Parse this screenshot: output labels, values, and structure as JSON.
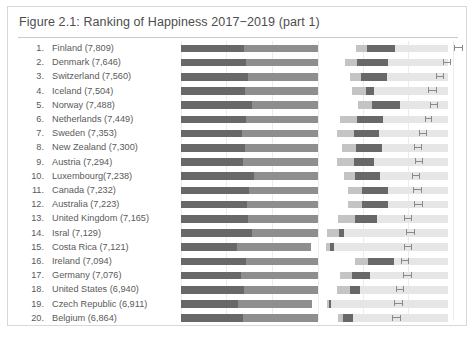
{
  "figure": {
    "title": "Figure 2.1: Ranking of Happiness 2017−2019 (part 1)"
  },
  "chart_data": {
    "type": "bar",
    "title": "Figure 2.1: Ranking of Happiness 2017−2019 (part 1)",
    "subtitle": "",
    "xlabel": "",
    "ylabel": "",
    "orientation": "horizontal",
    "stacked": true,
    "grid": true,
    "legend_position": "none",
    "axis_labels_visible": false,
    "note": "Horizontal stacked bars per country: a left bar group (dark + medium grey segments) and a right bar group (light + dark + very light segments) followed by a small horizontal error-bar marker at the far right.",
    "colors": {
      "dark": "#686868",
      "mid": "#8e8e8e",
      "light": "#c4c4c4",
      "faint": "#e6e6e6",
      "error_bar": "#8a8a8a",
      "gridline": "#ececec",
      "frame": "#d8d8d8",
      "rule": "#c9c9c9",
      "text": "#5a5a5a"
    },
    "series": [
      {
        "name": "left-dark"
      },
      {
        "name": "left-mid"
      },
      {
        "name": "right-light"
      },
      {
        "name": "right-dark"
      },
      {
        "name": "right-faint"
      }
    ],
    "categories": [
      "Finland",
      "Denmark",
      "Switzerland",
      "Iceland",
      "Norway",
      "Netherlands",
      "Sweden",
      "New Zealand",
      "Austria",
      "Luxembourg",
      "Canada",
      "Australia",
      "United Kingdom",
      "Isral",
      "Costa Rica",
      "Ireland",
      "Germany",
      "United States",
      "Czech Republic",
      "Belgium"
    ],
    "values": [
      7.809,
      7.646,
      7.56,
      7.504,
      7.488,
      7.449,
      7.353,
      7.3,
      7.294,
      7.238,
      7.232,
      7.223,
      7.165,
      7.129,
      7.121,
      7.094,
      7.076,
      6.94,
      6.911,
      6.864
    ],
    "rows": [
      {
        "rank": "1.",
        "label": "Finland (7,809)",
        "score": 7.809,
        "left_dark": 63,
        "left_total": 137,
        "right_start": 30,
        "right_light": 11,
        "right_dark": 28,
        "right_end": 122,
        "err_x": 128,
        "err_w": 9
      },
      {
        "rank": "2.",
        "label": "Denmark (7,646)",
        "score": 7.646,
        "left_dark": 65,
        "left_total": 137,
        "right_start": 19,
        "right_light": 12,
        "right_dark": 31,
        "right_end": 122,
        "err_x": 117,
        "err_w": 8
      },
      {
        "rank": "3.",
        "label": "Switzerland (7,560)",
        "score": 7.56,
        "left_dark": 67,
        "left_total": 137,
        "right_start": 24,
        "right_light": 11,
        "right_dark": 26,
        "right_end": 122,
        "err_x": 110,
        "err_w": 8
      },
      {
        "rank": "4.",
        "label": "Iceland (7,504)",
        "score": 7.504,
        "left_dark": 64,
        "left_total": 137,
        "right_start": 26,
        "right_light": 14,
        "right_dark": 8,
        "right_end": 122,
        "err_x": 102,
        "err_w": 9
      },
      {
        "rank": "5.",
        "label": "Norway (7,488)",
        "score": 7.488,
        "left_dark": 71,
        "left_total": 137,
        "right_start": 32,
        "right_light": 14,
        "right_dark": 28,
        "right_end": 122,
        "err_x": 104,
        "err_w": 8
      },
      {
        "rank": "6.",
        "label": "Netherlands (7,449)",
        "score": 7.449,
        "left_dark": 65,
        "left_total": 137,
        "right_start": 14,
        "right_light": 17,
        "right_dark": 26,
        "right_end": 122,
        "err_x": 99,
        "err_w": 7
      },
      {
        "rank": "7.",
        "label": "Sweden (7,353)",
        "score": 7.353,
        "left_dark": 61,
        "left_total": 137,
        "right_start": 11,
        "right_light": 17,
        "right_dark": 25,
        "right_end": 122,
        "err_x": 93,
        "err_w": 8
      },
      {
        "rank": "8.",
        "label": "New Zealand (7,300)",
        "score": 7.3,
        "left_dark": 64,
        "left_total": 137,
        "right_start": 16,
        "right_light": 14,
        "right_dark": 26,
        "right_end": 122,
        "err_x": 88,
        "err_w": 8
      },
      {
        "rank": "9.",
        "label": "Austria (7,294)",
        "score": 7.294,
        "left_dark": 62,
        "left_total": 137,
        "right_start": 11,
        "right_light": 17,
        "right_dark": 20,
        "right_end": 122,
        "err_x": 89,
        "err_w": 8
      },
      {
        "rank": "10.",
        "label": "Luxembourg(7,238)",
        "score": 7.238,
        "left_dark": 73,
        "left_total": 137,
        "right_start": 18,
        "right_light": 11,
        "right_dark": 25,
        "right_end": 122,
        "err_x": 86,
        "err_w": 8
      },
      {
        "rank": "11.",
        "label": "Canada (7,232)",
        "score": 7.232,
        "left_dark": 68,
        "left_total": 137,
        "right_start": 22,
        "right_light": 14,
        "right_dark": 26,
        "right_end": 122,
        "err_x": 87,
        "err_w": 9
      },
      {
        "rank": "12.",
        "label": "Australia (7,223)",
        "score": 7.223,
        "left_dark": 66,
        "left_total": 137,
        "right_start": 22,
        "right_light": 14,
        "right_dark": 26,
        "right_end": 122,
        "err_x": 88,
        "err_w": 9
      },
      {
        "rank": "13.",
        "label": "United Kingdom (7,165)",
        "score": 7.165,
        "left_dark": 67,
        "left_total": 137,
        "right_start": 12,
        "right_light": 17,
        "right_dark": 22,
        "right_end": 122,
        "err_x": 78,
        "err_w": 8
      },
      {
        "rank": "14.",
        "label": "Isral (7,129)",
        "score": 7.129,
        "left_dark": 71,
        "left_total": 137,
        "right_start": 1,
        "right_light": 12,
        "right_dark": 5,
        "right_end": 122,
        "err_x": 80,
        "err_w": 9
      },
      {
        "rank": "15.",
        "label": "Costa Rica (7,121)",
        "score": 7.121,
        "left_dark": 56,
        "left_total": 130,
        "right_start": 0,
        "right_light": 4,
        "right_dark": 4,
        "right_end": 122,
        "err_x": 78,
        "err_w": 8
      },
      {
        "rank": "16.",
        "label": "Ireland (7,094)",
        "score": 7.094,
        "left_dark": 65,
        "left_total": 137,
        "right_start": 29,
        "right_light": 13,
        "right_dark": 26,
        "right_end": 122,
        "err_x": 75,
        "err_w": 8
      },
      {
        "rank": "17.",
        "label": "Germany (7,076)",
        "score": 7.076,
        "left_dark": 60,
        "left_total": 137,
        "right_start": 14,
        "right_light": 12,
        "right_dark": 18,
        "right_end": 122,
        "err_x": 77,
        "err_w": 9
      },
      {
        "rank": "18.",
        "label": "United States (6,940)",
        "score": 6.94,
        "left_dark": 63,
        "left_total": 137,
        "right_start": 11,
        "right_light": 13,
        "right_dark": 10,
        "right_end": 122,
        "err_x": 70,
        "err_w": 8
      },
      {
        "rank": "19.",
        "label": "Czech Republic (6,911)",
        "score": 6.911,
        "left_dark": 57,
        "left_total": 131,
        "right_start": 1,
        "right_light": 2,
        "right_dark": 2,
        "right_end": 122,
        "err_x": 68,
        "err_w": 9
      },
      {
        "rank": "20.",
        "label": "Belgium (6,864)",
        "score": 6.864,
        "left_dark": 62,
        "left_total": 137,
        "right_start": 12,
        "right_light": 5,
        "right_dark": 10,
        "right_end": 122,
        "err_x": 66,
        "err_w": 9
      }
    ],
    "gridlines_x": [
      173,
      218,
      264,
      310,
      355,
      400,
      445
    ]
  }
}
